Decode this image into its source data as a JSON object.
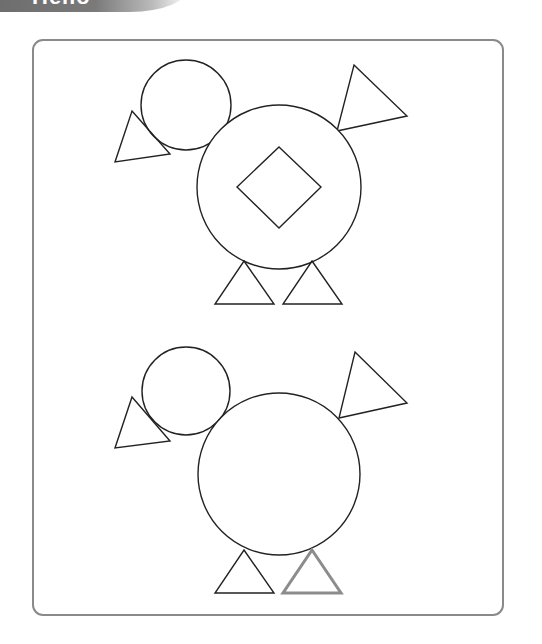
{
  "header": {
    "banner_text": "Hello",
    "banner_color": "#707070"
  },
  "worksheet": {
    "frame_color": "#8a8a8a",
    "line_color": "#222222",
    "highlight_color": "#8c8c8c",
    "figures": [
      {
        "id": "duck-top",
        "shapes": [
          "head-circle",
          "beak-triangle",
          "body-circle",
          "diamond",
          "tail-triangle",
          "left-leg-triangle",
          "right-leg-triangle"
        ]
      },
      {
        "id": "duck-bottom",
        "shapes": [
          "head-circle",
          "beak-triangle",
          "body-circle",
          "tail-triangle",
          "left-leg-triangle",
          "right-leg-triangle-highlighted"
        ],
        "missing_shape": "diamond"
      }
    ]
  }
}
